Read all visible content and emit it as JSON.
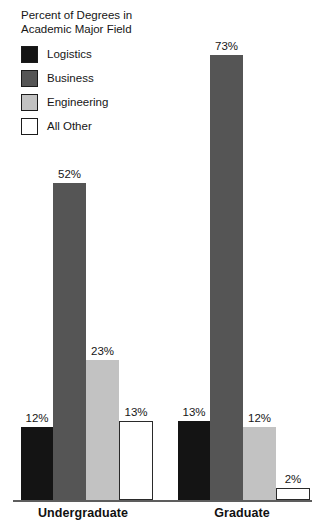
{
  "chart_data": {
    "type": "bar",
    "title": "Percent of Degrees in\nAcademic Major Field",
    "xlabel": "",
    "ylabel": "",
    "ylim": [
      0,
      80
    ],
    "grid": false,
    "legend_position": "top-left",
    "value_suffix": "%",
    "categories": [
      "Undergraduate",
      "Graduate"
    ],
    "series": [
      {
        "name": "Logistics",
        "color": "#141414",
        "values": [
          12,
          13
        ],
        "labels": [
          "12%",
          "13%"
        ]
      },
      {
        "name": "Business",
        "color": "#555555",
        "values": [
          52,
          73
        ],
        "labels": [
          "52%",
          "73%"
        ]
      },
      {
        "name": "Engineering",
        "color": "#c2c2c2",
        "values": [
          23,
          12
        ],
        "labels": [
          "23%",
          "12%"
        ]
      },
      {
        "name": "All Other",
        "color": "#ffffff",
        "values": [
          13,
          2
        ],
        "labels": [
          "13%",
          "2%"
        ]
      }
    ]
  },
  "legend": {
    "items": [
      {
        "label": "Logistics"
      },
      {
        "label": "Business"
      },
      {
        "label": "Engineering"
      },
      {
        "label": "All Other"
      }
    ]
  },
  "axis": {
    "group_labels": [
      "Undergraduate",
      "Graduate"
    ]
  }
}
